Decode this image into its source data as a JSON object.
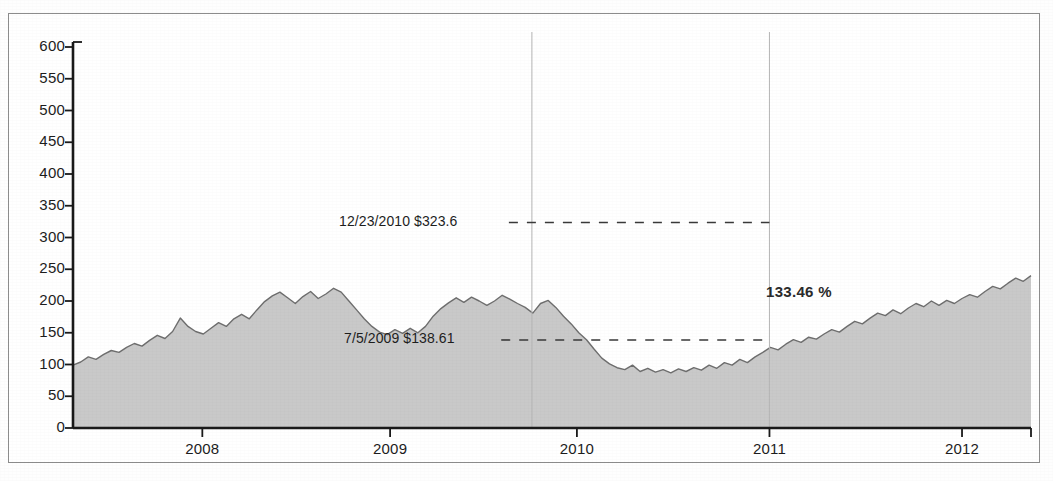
{
  "chart_data": {
    "type": "area",
    "title": "",
    "subtitle": "",
    "xlabel": "",
    "ylabel": "",
    "grid": false,
    "legend": "none",
    "xlim": [
      "2007-06-01",
      "2012-06-01"
    ],
    "ylim": [
      0,
      650
    ],
    "y_ticks": [
      0,
      50,
      100,
      150,
      200,
      250,
      300,
      350,
      400,
      450,
      500,
      550,
      600
    ],
    "x_ticks": [
      "2008",
      "2009",
      "2010",
      "2011",
      "2012"
    ],
    "x_tick_positions_frac": [
      0.135,
      0.331,
      0.526,
      0.727,
      0.928
    ],
    "series": [
      {
        "name": "Price",
        "fill_color": "#c9c9c9",
        "line_color": "#6e6e6e",
        "x_frac": [
          0.0,
          0.008,
          0.016,
          0.024,
          0.032,
          0.04,
          0.048,
          0.056,
          0.064,
          0.072,
          0.08,
          0.088,
          0.096,
          0.104,
          0.112,
          0.12,
          0.128,
          0.136,
          0.144,
          0.152,
          0.16,
          0.168,
          0.176,
          0.184,
          0.192,
          0.2,
          0.208,
          0.216,
          0.224,
          0.232,
          0.24,
          0.248,
          0.256,
          0.264,
          0.272,
          0.28,
          0.288,
          0.296,
          0.304,
          0.312,
          0.32,
          0.328,
          0.336,
          0.344,
          0.352,
          0.36,
          0.368,
          0.376,
          0.384,
          0.392,
          0.4,
          0.408,
          0.416,
          0.424,
          0.432,
          0.44,
          0.448,
          0.456,
          0.464,
          0.472,
          0.48,
          0.488,
          0.496,
          0.504,
          0.512,
          0.52,
          0.528,
          0.536,
          0.544,
          0.552,
          0.56,
          0.568,
          0.576,
          0.584,
          0.592,
          0.6,
          0.608,
          0.616,
          0.624,
          0.632,
          0.64,
          0.648,
          0.656,
          0.664,
          0.672,
          0.68,
          0.688,
          0.696,
          0.704,
          0.712,
          0.72,
          0.728,
          0.736,
          0.744,
          0.752,
          0.76,
          0.768,
          0.776,
          0.784,
          0.792,
          0.8,
          0.808,
          0.816,
          0.824,
          0.832,
          0.84,
          0.848,
          0.856,
          0.864,
          0.872,
          0.88,
          0.888,
          0.896,
          0.904,
          0.912,
          0.92,
          0.928,
          0.936,
          0.944,
          0.952,
          0.96,
          0.968,
          0.976,
          0.984,
          0.992,
          1.0
        ],
        "values": [
          99,
          104,
          112,
          108,
          116,
          122,
          119,
          127,
          133,
          129,
          138,
          146,
          141,
          152,
          173,
          160,
          152,
          148,
          157,
          166,
          160,
          172,
          179,
          172,
          186,
          199,
          208,
          214,
          205,
          196,
          207,
          215,
          204,
          211,
          220,
          214,
          200,
          186,
          172,
          160,
          151,
          147,
          155,
          149,
          157,
          150,
          160,
          176,
          188,
          197,
          205,
          198,
          206,
          200,
          193,
          200,
          209,
          203,
          196,
          190,
          181,
          196,
          201,
          190,
          176,
          164,
          150,
          139,
          124,
          110,
          101,
          95,
          92,
          99,
          89,
          94,
          88,
          92,
          87,
          93,
          89,
          95,
          91,
          99,
          94,
          103,
          99,
          108,
          103,
          112,
          119,
          127,
          123,
          132,
          139,
          135,
          143,
          140,
          148,
          155,
          151,
          160,
          168,
          164,
          173,
          181,
          177,
          186,
          180,
          189,
          196,
          191,
          200,
          193,
          201,
          196,
          204,
          210,
          206,
          215,
          223,
          219,
          228,
          236,
          231,
          240
        ]
      }
    ],
    "annotations": [
      {
        "name": "upper-price-marker",
        "label": "12/23/2010 $323.6",
        "date": "12/23/2010",
        "value": 323.6,
        "line_style": "dashed",
        "line_y_value": 323.6
      },
      {
        "name": "lower-price-marker",
        "label": "7/5/2009 $138.61",
        "date": "7/5/2009",
        "value": 138.61,
        "line_style": "dashed",
        "line_y_value": 138.61
      },
      {
        "name": "percent-change-label",
        "label": "133.46 %",
        "value": 133.46,
        "unit": "%"
      }
    ],
    "vertical_markers": [
      {
        "name": "selection-start",
        "x_frac": 0.479
      },
      {
        "name": "selection-end",
        "x_frac": 0.727
      }
    ],
    "colors": {
      "area_fill": "#c9c9c9",
      "area_line": "#6e6e6e",
      "axis": "#1a1a1a",
      "text": "#1d1d1d",
      "frame": "#8d8d8d",
      "dashed_guide": "#3a3a3a"
    }
  }
}
